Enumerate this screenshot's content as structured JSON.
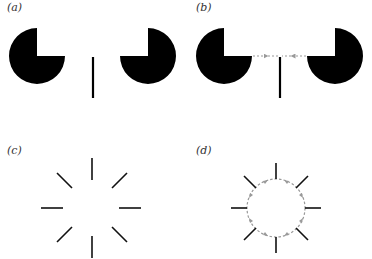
{
  "panels": [
    {
      "id": "a",
      "label": "(a)"
    },
    {
      "id": "b",
      "label": "(b)"
    },
    {
      "id": "c",
      "label": "(c)"
    },
    {
      "id": "d",
      "label": "(d)"
    }
  ],
  "colors": {
    "figure": "#000000",
    "arrows": "#999999",
    "background": "#ffffff"
  }
}
